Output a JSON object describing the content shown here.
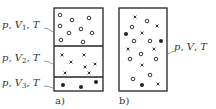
{
  "figure": {
    "panel_a": {
      "caption": "a)",
      "box": {
        "x": 54,
        "y": 8,
        "w": 49,
        "h": 83
      },
      "dividers_y": [
        46,
        77
      ],
      "compartments": [
        {
          "label": "p, V₁, T",
          "label_parts": {
            "p": "p",
            "V": "V",
            "sub": "1",
            "T": "T"
          },
          "label_pos": {
            "x": 2,
            "y": 28
          },
          "leader": {
            "x1": 44,
            "y1": 28,
            "x2": 53,
            "y2": 32
          },
          "particle_type": "open-circle",
          "particles": [
            [
              60,
              15
            ],
            [
              72,
              20
            ],
            [
              89,
              18
            ],
            [
              60,
              26
            ],
            [
              69,
              33
            ],
            [
              81,
              29
            ],
            [
              92,
              33
            ],
            [
              61,
              40
            ],
            [
              83,
              42
            ]
          ]
        },
        {
          "label": "p, V₂, T",
          "label_parts": {
            "p": "p",
            "V": "V",
            "sub": "2",
            "T": "T"
          },
          "label_pos": {
            "x": 2,
            "y": 61
          },
          "leader": {
            "x1": 44,
            "y1": 61,
            "x2": 53,
            "y2": 64
          },
          "particle_type": "cross",
          "particles": [
            [
              62,
              55
            ],
            [
              84,
              55
            ],
            [
              71,
              62
            ],
            [
              95,
              64
            ],
            [
              85,
              67
            ],
            [
              65,
              73
            ],
            [
              89,
              73
            ]
          ]
        },
        {
          "label": "p, V₃, T",
          "label_parts": {
            "p": "p",
            "V": "V",
            "sub": "3",
            "T": "T"
          },
          "label_pos": {
            "x": 2,
            "y": 86
          },
          "leader": {
            "x1": 44,
            "y1": 86,
            "x2": 53,
            "y2": 88
          },
          "particle_type": "filled-circle",
          "particles": [
            [
              63,
              85
            ],
            [
              81,
              87
            ],
            [
              96,
              82
            ]
          ]
        }
      ]
    },
    "panel_b": {
      "caption": "b)",
      "box": {
        "x": 119,
        "y": 8,
        "w": 48,
        "h": 83
      },
      "label": "p, V, T",
      "label_parts": {
        "p": "p",
        "V": "V",
        "T": "T"
      },
      "label_pos": {
        "x": 174,
        "y": 50
      },
      "leader": {
        "x1": 167,
        "y1": 54,
        "x2": 174,
        "y2": 51
      },
      "particles": {
        "open-circle": [
          [
            147,
            21
          ],
          [
            132,
            27
          ],
          [
            134,
            41
          ],
          [
            150,
            41
          ],
          [
            141,
            54
          ],
          [
            130,
            59
          ],
          [
            156,
            59
          ],
          [
            133,
            79
          ],
          [
            150,
            75
          ]
        ],
        "cross": [
          [
            135,
            17
          ],
          [
            157,
            26
          ],
          [
            142,
            33
          ],
          [
            128,
            49
          ],
          [
            154,
            49
          ],
          [
            142,
            65
          ],
          [
            158,
            84
          ]
        ],
        "filled-circle": [
          [
            126,
            34
          ],
          [
            161,
            41
          ],
          [
            142,
            85
          ]
        ]
      }
    },
    "colors": {
      "stroke": "#222222",
      "text": "#333333",
      "background": "#ffffff"
    }
  }
}
